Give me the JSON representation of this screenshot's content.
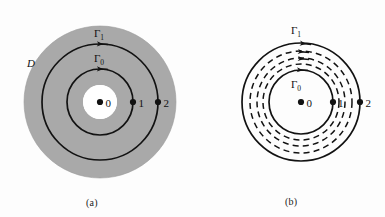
{
  "figure": {
    "background_color": "#fdfdfd",
    "stroke_color": "#121212",
    "shade_color": "#a9a9a9",
    "unshaded_color": "#ffffff"
  },
  "panels": [
    {
      "id": "a",
      "caption": "(a)",
      "center": {
        "x": 100,
        "y": 102
      },
      "shaded_region_label": "D",
      "shaded_disc_radius": 76,
      "hole_radius": 17,
      "curves": [
        {
          "name": "Gamma_1",
          "label": "Γ",
          "label_sub": "1",
          "radius": 58,
          "style": "solid",
          "direction": "clockwise",
          "arrow_count": 1
        },
        {
          "name": "Gamma_0",
          "label": "Γ",
          "label_sub": "0",
          "radius": 33,
          "style": "solid",
          "direction": "clockwise",
          "arrow_count": 1
        }
      ],
      "points": [
        {
          "label": "0",
          "x_offset": 0,
          "radius_on": 0
        },
        {
          "label": "1",
          "x_offset": 33,
          "radius_on": 33
        },
        {
          "label": "2",
          "x_offset": 58,
          "radius_on": 58
        }
      ]
    },
    {
      "id": "b",
      "caption": "(b)",
      "center": {
        "x": 301,
        "y": 102
      },
      "curves": [
        {
          "name": "Gamma_1",
          "label": "Γ",
          "label_sub": "1",
          "radius": 59,
          "style": "solid",
          "direction": "clockwise",
          "arrow_count": 1
        },
        {
          "name": "deformation_1",
          "radius": 51,
          "style": "dashed",
          "direction": "clockwise",
          "arrow_count": 1
        },
        {
          "name": "deformation_2",
          "radius": 44,
          "style": "dashed",
          "direction": "clockwise",
          "arrow_count": 1
        },
        {
          "name": "deformation_3",
          "radius": 38,
          "style": "dashed",
          "direction": "clockwise",
          "arrow_count": 0
        },
        {
          "name": "Gamma_0",
          "label": "Γ",
          "label_sub": "0",
          "radius": 32,
          "style": "solid",
          "direction": "clockwise",
          "arrow_count": 1
        }
      ],
      "points": [
        {
          "label": "0",
          "x_offset": 0,
          "radius_on": 0
        },
        {
          "label": "1",
          "x_offset": 32,
          "radius_on": 32
        },
        {
          "label": "2",
          "x_offset": 59,
          "radius_on": 59
        }
      ]
    }
  ]
}
